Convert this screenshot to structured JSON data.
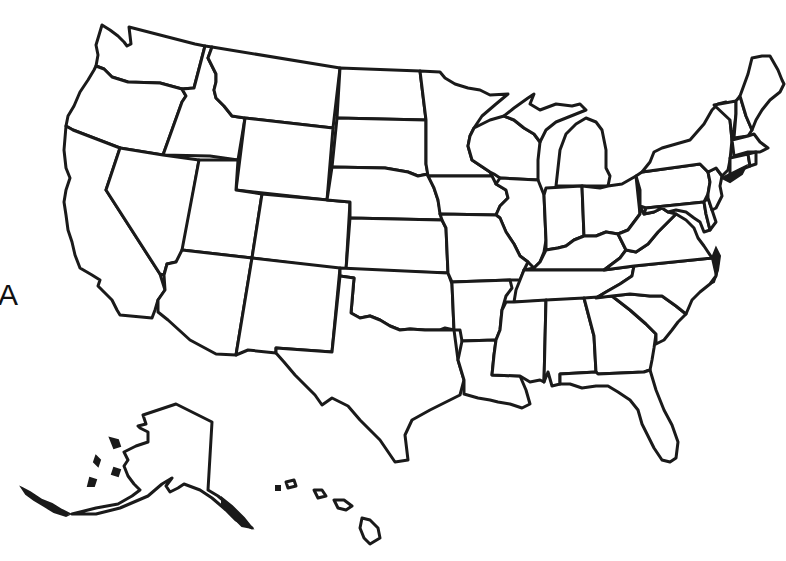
{
  "map": {
    "type": "blank-outline",
    "subject": "United States",
    "edge_label": "A",
    "colors": {
      "background": "#ffffff",
      "border": "#1a1a1a"
    },
    "regions": [
      "Washington",
      "Oregon",
      "California",
      "Idaho",
      "Nevada",
      "Montana",
      "Wyoming",
      "Utah",
      "Arizona",
      "Colorado",
      "New Mexico",
      "North Dakota",
      "South Dakota",
      "Nebraska",
      "Kansas",
      "Oklahoma",
      "Texas",
      "Minnesota",
      "Iowa",
      "Missouri",
      "Arkansas",
      "Louisiana",
      "Wisconsin",
      "Illinois",
      "Michigan",
      "Indiana",
      "Ohio",
      "Kentucky",
      "Tennessee",
      "Mississippi",
      "Alabama",
      "Georgia",
      "Florida",
      "South Carolina",
      "North Carolina",
      "Virginia",
      "West Virginia",
      "Maryland",
      "Delaware",
      "Pennsylvania",
      "New Jersey",
      "New York",
      "Connecticut",
      "Rhode Island",
      "Massachusetts",
      "Vermont",
      "New Hampshire",
      "Maine",
      "Alaska",
      "Hawaii"
    ]
  }
}
